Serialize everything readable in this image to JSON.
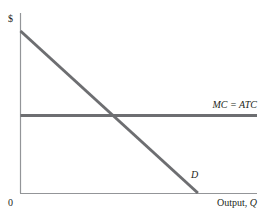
{
  "chart_data": {
    "type": "line",
    "title": "",
    "xlabel": "Output, Q",
    "ylabel": "$",
    "origin_label": "0",
    "xlim": [
      0,
      100
    ],
    "ylim": [
      0,
      100
    ],
    "grid": false,
    "series": [
      {
        "name": "D",
        "label": "D",
        "color": "#6d6e71",
        "points": [
          [
            0,
            90
          ],
          [
            75,
            0
          ]
        ]
      },
      {
        "name": "MC = ATC",
        "label": "MC = ATC",
        "color": "#6d6e71",
        "points": [
          [
            0,
            43
          ],
          [
            100,
            43
          ]
        ]
      }
    ]
  }
}
